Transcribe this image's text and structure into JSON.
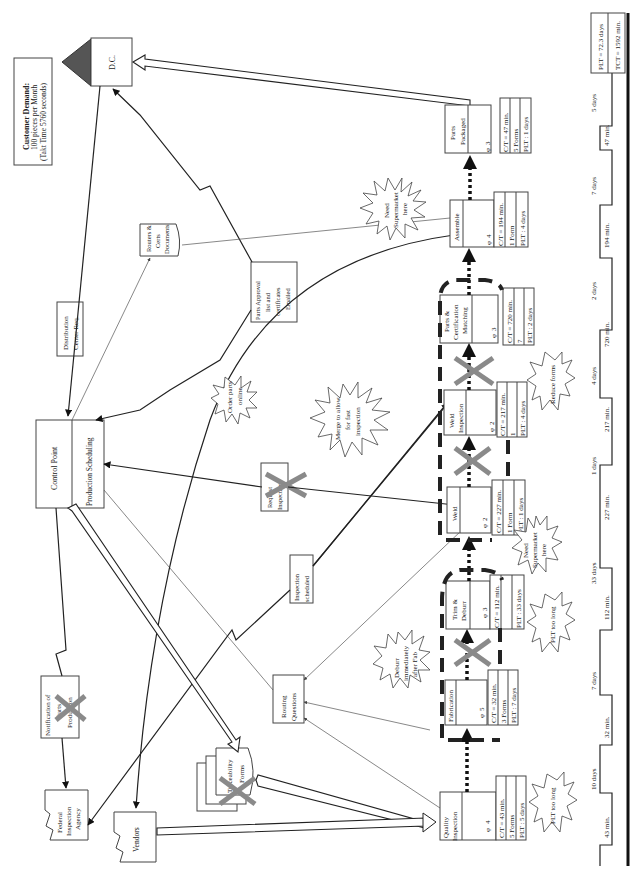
{
  "customer_demand": {
    "title": "Customer Demand:",
    "line1": "100  pieces per Month",
    "line2": "(Takt Time 5760  seconds)"
  },
  "customer": {
    "label": "D.C."
  },
  "control": {
    "label": "Control Point",
    "sub_label": "Production Scheduling"
  },
  "external": {
    "federal": [
      "Federal",
      "Inspection",
      "Agency"
    ],
    "vendors": "Vendors"
  },
  "info_boxes": {
    "distribution_req": [
      "Distribution",
      "Center Req."
    ],
    "routers_certs": [
      "Routers &",
      "Certs",
      "Documents"
    ],
    "parts_approval": [
      "Parts Approval",
      "list and",
      "certificates",
      "Emailed"
    ],
    "request_inspection": [
      "Request",
      "Inspection"
    ],
    "inspection_scheduled": [
      "Inspection",
      "scheduled"
    ],
    "routing_questions": [
      "Routing",
      "Questions"
    ],
    "notification": [
      "Notification of",
      "Parts",
      "Production"
    ],
    "traceability": [
      "Traceability",
      "Forms"
    ]
  },
  "processes": [
    {
      "name": [
        "Quality",
        "Inspection"
      ],
      "operators": "4",
      "data": [
        "C/T = 43 min.",
        "5 Forms",
        "PLT : 5 days"
      ]
    },
    {
      "name": [
        "Fabrication"
      ],
      "operators": "5",
      "data": [
        "C/T = 32 min.",
        "3 Forms",
        "PLT : 7 days"
      ]
    },
    {
      "name": [
        "Trim &",
        "Deburr"
      ],
      "operators": "3",
      "data": [
        "C/T = 112 min.",
        "",
        "PLT : 33 days"
      ]
    },
    {
      "name": [
        "Weld"
      ],
      "operators": "2",
      "data": [
        "C/T = 227 min.",
        "1 Form",
        "PLT : 1 days"
      ]
    },
    {
      "name": [
        "Weld",
        "Inspection"
      ],
      "operators": "2",
      "data": [
        "C/T = 217 min.",
        "1",
        "PLT : 4 days"
      ]
    },
    {
      "name": [
        "Parts &",
        "Certification",
        "Matching"
      ],
      "operators": "3",
      "data": [
        "C/T = 720 min.",
        "7",
        "PLT : 2 days"
      ]
    },
    {
      "name": [
        "Assemble"
      ],
      "operators": "4",
      "data": [
        "C/T = 194 min.",
        "1 Form",
        "PLT : 4 days"
      ]
    },
    {
      "name": [
        "Parts",
        "Packaged"
      ],
      "operators": "3",
      "data": [
        "C/T = 47 min.",
        "5 Forms",
        "PLT : 1 days"
      ]
    }
  ],
  "kaizen_bursts": [
    {
      "id": "need-supermarket-top",
      "lines": [
        "Need",
        "Supermarket",
        "here"
      ]
    },
    {
      "id": "merge-fast-inspection",
      "lines": [
        "Merge to allow",
        "for fast",
        "inspection"
      ]
    },
    {
      "id": "order-parts-online",
      "lines": [
        "Order parts",
        "online"
      ]
    },
    {
      "id": "deburr-after-fab",
      "lines": [
        "Deburr",
        "immediately",
        "after Fab"
      ]
    },
    {
      "id": "reduce-forms",
      "lines": [
        "Reduce forms"
      ]
    },
    {
      "id": "need-supermarket-mid",
      "lines": [
        "Need",
        "Supermarket",
        "here"
      ]
    },
    {
      "id": "plt-too-long-trim",
      "lines": [
        "PLT too long"
      ]
    },
    {
      "id": "plt-too-long-qi",
      "lines": [
        "PLT too long"
      ]
    }
  ],
  "timeline": {
    "value_times": [
      "43 min.",
      "32 min.",
      "112 min.",
      "227 min.",
      "217 min.",
      "720 min.",
      "194 min.",
      "47 min."
    ],
    "wait_times": [
      "10 days",
      "7 days",
      "33 days",
      "1 days",
      "4 days",
      "2 days",
      "7 days",
      "5 days"
    ],
    "summary": {
      "plt": "PLT = 72.3 days",
      "tct": "TCT = 1592 min."
    }
  }
}
